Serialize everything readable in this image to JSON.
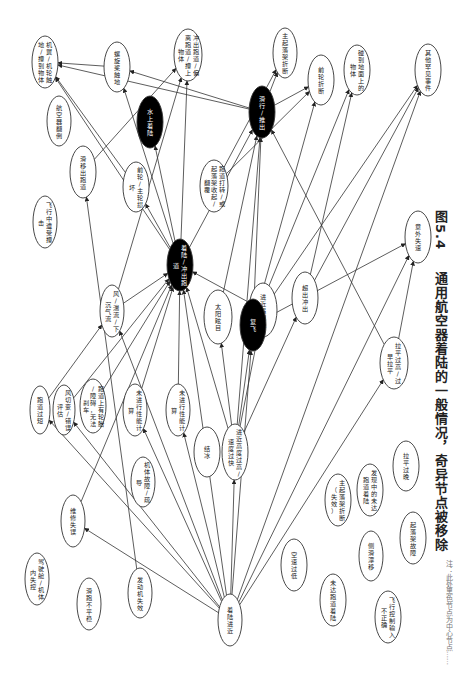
{
  "figure": {
    "number": "图5.4",
    "caption": "通用航空器着陆的一般情况，奇异节点被移除",
    "footnote": "注：此处黑色节点为中心节点……"
  },
  "colors": {
    "edge": "#333333",
    "node_fill": "#ffffff",
    "node_stroke": "#333333",
    "dark_node_fill": "#000000"
  },
  "nodes": [
    {
      "id": "n1",
      "label": "机翼/机轮触地/撞到物体",
      "x": 45,
      "y": 62,
      "rx": 13,
      "ry": 26,
      "dark": false
    },
    {
      "id": "n2",
      "label": "螺旋桨触地",
      "x": 117,
      "y": 67,
      "rx": 13,
      "ry": 25,
      "dark": false
    },
    {
      "id": "n3",
      "label": "冲出跑道/偏离跑道/撞上物体",
      "x": 188,
      "y": 55,
      "rx": 14,
      "ry": 26,
      "dark": false
    },
    {
      "id": "n4",
      "label": "航空器翻倒",
      "x": 59,
      "y": 121,
      "rx": 12,
      "ry": 25,
      "dark": false
    },
    {
      "id": "n5",
      "label": "水上着陆",
      "x": 150,
      "y": 122,
      "rx": 13,
      "ry": 26,
      "dark": true
    },
    {
      "id": "n6",
      "label": "滑移出跑道",
      "x": 83,
      "y": 172,
      "rx": 13,
      "ry": 26,
      "dark": false
    },
    {
      "id": "n7",
      "label": "前轮/主轮损坏",
      "x": 136,
      "y": 187,
      "rx": 13,
      "ry": 25,
      "dark": false
    },
    {
      "id": "n8",
      "label": "跑道打转/或起落架收起/翻覆",
      "x": 214,
      "y": 186,
      "rx": 14,
      "ry": 26,
      "dark": false
    },
    {
      "id": "n9",
      "label": "飞行中遭受撞击",
      "x": 45,
      "y": 222,
      "rx": 12,
      "ry": 26,
      "dark": false
    },
    {
      "id": "n10",
      "label": "着陆/冲出跑道",
      "x": 180,
      "y": 265,
      "rx": 13,
      "ry": 26,
      "dark": true
    },
    {
      "id": "n11",
      "label": "风/湍流/下沉气流",
      "x": 112,
      "y": 311,
      "rx": 12,
      "ry": 26,
      "dark": false
    },
    {
      "id": "n12",
      "label": "太阳眩目",
      "x": 218,
      "y": 317,
      "rx": 14,
      "ry": 27,
      "dark": false
    },
    {
      "id": "n13",
      "label": "进近遇侧风",
      "x": 263,
      "y": 310,
      "rx": 14,
      "ry": 27,
      "dark": false
    },
    {
      "id": "n14",
      "label": "复飞",
      "x": 253,
      "y": 325,
      "rx": 13,
      "ry": 26,
      "dark": true
    },
    {
      "id": "n15",
      "label": "滑行/推出",
      "x": 262,
      "y": 112,
      "rx": 13,
      "ry": 26,
      "dark": true
    },
    {
      "id": "n16",
      "label": "主起落架折断",
      "x": 285,
      "y": 53,
      "rx": 12,
      "ry": 25,
      "dark": false
    },
    {
      "id": "n17",
      "label": "前轮折断",
      "x": 321,
      "y": 80,
      "rx": 13,
      "ry": 25,
      "dark": false
    },
    {
      "id": "n18",
      "label": "碰到地面上的物体",
      "x": 357,
      "y": 70,
      "rx": 13,
      "ry": 25,
      "dark": false
    },
    {
      "id": "n19",
      "label": "其他罕见事件",
      "x": 428,
      "y": 70,
      "rx": 13,
      "ry": 26,
      "dark": false
    },
    {
      "id": "n20",
      "label": "超出冲出",
      "x": 305,
      "y": 298,
      "rx": 13,
      "ry": 26,
      "dark": false
    },
    {
      "id": "n21",
      "label": "意外失速",
      "x": 418,
      "y": 237,
      "rx": 13,
      "ry": 26,
      "dark": false
    },
    {
      "id": "n22",
      "label": "拉平过高/过早拉平",
      "x": 394,
      "y": 363,
      "rx": 14,
      "ry": 26,
      "dark": false
    },
    {
      "id": "n23",
      "label": "拉平过晚",
      "x": 406,
      "y": 466,
      "rx": 13,
      "ry": 25,
      "dark": false
    },
    {
      "id": "n24",
      "label": "跑道过短",
      "x": 40,
      "y": 410,
      "rx": 10,
      "ry": 24,
      "dark": false
    },
    {
      "id": "n25",
      "label": "风切变/错误评估",
      "x": 64,
      "y": 410,
      "rx": 11,
      "ry": 25,
      "dark": false
    },
    {
      "id": "n26",
      "label": "跑道上有轮胎/障碍，无法刹车",
      "x": 93,
      "y": 406,
      "rx": 13,
      "ry": 27,
      "dark": false
    },
    {
      "id": "n27",
      "label": "未进行性能计算",
      "x": 135,
      "y": 410,
      "rx": 12,
      "ry": 26,
      "dark": false
    },
    {
      "id": "n28",
      "label": "未进行性能计算",
      "x": 178,
      "y": 410,
      "rx": 12,
      "ry": 26,
      "dark": false
    },
    {
      "id": "n29",
      "label": "结冰",
      "x": 207,
      "y": 452,
      "rx": 13,
      "ry": 25,
      "dark": false
    },
    {
      "id": "n30",
      "label": "进近高度过高/速度过快",
      "x": 235,
      "y": 452,
      "rx": 13,
      "ry": 28,
      "dark": false
    },
    {
      "id": "n31",
      "label": "机体故障/疏导",
      "x": 143,
      "y": 482,
      "rx": 12,
      "ry": 25,
      "dark": false
    },
    {
      "id": "n32",
      "label": "维修失误",
      "x": 73,
      "y": 521,
      "rx": 12,
      "ry": 26,
      "dark": false
    },
    {
      "id": "n33",
      "label": "驾驶舱/机体内失控",
      "x": 37,
      "y": 579,
      "rx": 12,
      "ry": 26,
      "dark": false
    },
    {
      "id": "n34",
      "label": "滑跑不平稳",
      "x": 89,
      "y": 604,
      "rx": 12,
      "ry": 26,
      "dark": false
    },
    {
      "id": "n35",
      "label": "发动机失效",
      "x": 140,
      "y": 593,
      "rx": 12,
      "ry": 25,
      "dark": false
    },
    {
      "id": "n36",
      "label": "着陆进近",
      "x": 230,
      "y": 620,
      "rx": 12,
      "ry": 26,
      "dark": false
    },
    {
      "id": "n37",
      "label": "空速过低",
      "x": 294,
      "y": 565,
      "rx": 13,
      "ry": 26,
      "dark": false
    },
    {
      "id": "n38",
      "label": "主起落架折断（失效）",
      "x": 338,
      "y": 500,
      "rx": 13,
      "ry": 26,
      "dark": false
    },
    {
      "id": "n39",
      "label": "发现中的未达跑道着陆",
      "x": 370,
      "y": 490,
      "rx": 13,
      "ry": 26,
      "dark": false
    },
    {
      "id": "n40",
      "label": "侧滑漂移",
      "x": 371,
      "y": 556,
      "rx": 12,
      "ry": 25,
      "dark": false
    },
    {
      "id": "n41",
      "label": "起落架故障",
      "x": 413,
      "y": 538,
      "rx": 13,
      "ry": 26,
      "dark": false
    },
    {
      "id": "n42",
      "label": "未达跑道着陆",
      "x": 333,
      "y": 600,
      "rx": 13,
      "ry": 26,
      "dark": false
    },
    {
      "id": "n43",
      "label": "飞行控制输入不正确",
      "x": 388,
      "y": 617,
      "rx": 13,
      "ry": 26,
      "dark": false
    }
  ],
  "edges": [
    [
      "n36",
      "n32"
    ],
    [
      "n36",
      "n24"
    ],
    [
      "n36",
      "n25"
    ],
    [
      "n36",
      "n11"
    ],
    [
      "n36",
      "n27"
    ],
    [
      "n36",
      "n28"
    ],
    [
      "n36",
      "n30"
    ],
    [
      "n36",
      "n14"
    ],
    [
      "n36",
      "n22"
    ],
    [
      "n36",
      "n21"
    ],
    [
      "n36",
      "n19"
    ],
    [
      "n36",
      "n10"
    ],
    [
      "n30",
      "n12"
    ],
    [
      "n30",
      "n13"
    ],
    [
      "n30",
      "n10"
    ],
    [
      "n30",
      "n14"
    ],
    [
      "n30",
      "n15"
    ],
    [
      "n30",
      "n20"
    ],
    [
      "n24",
      "n11"
    ],
    [
      "n25",
      "n10"
    ],
    [
      "n27",
      "n10"
    ],
    [
      "n28",
      "n10"
    ],
    [
      "n11",
      "n10"
    ],
    [
      "n11",
      "n3"
    ],
    [
      "n26",
      "n10"
    ],
    [
      "n32",
      "n10"
    ],
    [
      "n10",
      "n15"
    ],
    [
      "n10",
      "n2"
    ],
    [
      "n10",
      "n1"
    ],
    [
      "n10",
      "n5"
    ],
    [
      "n10",
      "n7"
    ],
    [
      "n10",
      "n3"
    ],
    [
      "n6",
      "n3"
    ],
    [
      "n7",
      "n1"
    ],
    [
      "n14",
      "n21"
    ],
    [
      "n14",
      "n15"
    ],
    [
      "n14",
      "n17"
    ],
    [
      "n14",
      "n18"
    ],
    [
      "n14",
      "n19"
    ],
    [
      "n22",
      "n21"
    ],
    [
      "n22",
      "n15"
    ],
    [
      "n20",
      "n19"
    ],
    [
      "n20",
      "n18"
    ],
    [
      "n15",
      "n16"
    ],
    [
      "n15",
      "n17"
    ],
    [
      "n15",
      "n2"
    ],
    [
      "n15",
      "n1"
    ],
    [
      "n12",
      "n15"
    ],
    [
      "n13",
      "n10"
    ],
    [
      "n8",
      "n17"
    ],
    [
      "n8",
      "n16"
    ],
    [
      "n35",
      "n6"
    ],
    [
      "n2",
      "n1"
    ]
  ]
}
